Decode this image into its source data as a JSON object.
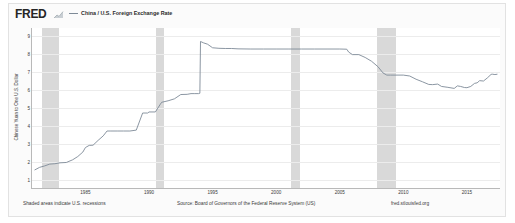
{
  "header": {
    "logo_text": "FRED",
    "logo_icon": "fred-graph-icon",
    "legend": [
      {
        "label": "China / U.S. Foreign Exchange Rate",
        "color": "#7e8a97",
        "swatch_icon": "line-swatch-icon"
      }
    ]
  },
  "footer": {
    "recession_note": "Shaded areas indicate U.S. recessions",
    "source": "Source: Board of Governors of the Federal Reserve System (US)",
    "url": "fred.stlouisfed.org"
  },
  "chart_data": {
    "type": "line",
    "title": "China / U.S. Foreign Exchange Rate",
    "xlabel": "",
    "ylabel": "Chinese Yuan to One U.S. Dollar",
    "xlim": [
      1980.8,
      2017.6
    ],
    "ylim": [
      0.55,
      9.45
    ],
    "grid": true,
    "legend_position": "top-left",
    "xticks": [
      "1985",
      "1990",
      "1995",
      "2000",
      "2005",
      "2010",
      "2015"
    ],
    "xtick_values": [
      1985,
      1990,
      1995,
      2000,
      2005,
      2010,
      2015
    ],
    "yticks": [
      "1",
      "2",
      "3",
      "4",
      "5",
      "6",
      "7",
      "8",
      "9"
    ],
    "ytick_values": [
      1,
      2,
      3,
      4,
      5,
      6,
      7,
      8,
      9
    ],
    "series": [
      {
        "name": "China / U.S. Foreign Exchange Rate",
        "color": "#7e8a97",
        "x": [
          1981.0,
          1981.4,
          1981.8,
          1982.2,
          1982.6,
          1983.0,
          1983.5,
          1984.0,
          1984.4,
          1984.8,
          1985.0,
          1985.3,
          1985.6,
          1986.0,
          1986.4,
          1986.7,
          1987.0,
          1987.5,
          1988.0,
          1988.5,
          1989.0,
          1989.5,
          1989.9,
          1990.0,
          1990.5,
          1990.9,
          1991.0,
          1991.5,
          1992.0,
          1992.5,
          1993.0,
          1993.3,
          1993.6,
          1993.9,
          1994.0,
          1994.05,
          1994.3,
          1994.6,
          1995.0,
          1995.5,
          1996.0,
          1996.5,
          1997.0,
          1998.0,
          1999.0,
          2000.0,
          2001.0,
          2002.0,
          2003.0,
          2004.0,
          2005.0,
          2005.55,
          2005.7,
          2006.0,
          2006.5,
          2007.0,
          2007.5,
          2008.0,
          2008.4,
          2008.7,
          2009.0,
          2009.5,
          2010.0,
          2010.5,
          2011.0,
          2011.5,
          2012.0,
          2012.3,
          2012.7,
          2013.0,
          2013.5,
          2014.0,
          2014.25,
          2014.5,
          2014.8,
          2015.0,
          2015.3,
          2015.6,
          2015.8,
          2016.0,
          2016.3,
          2016.6,
          2016.9,
          2017.0,
          2017.2,
          2017.4
        ],
        "y": [
          1.55,
          1.7,
          1.78,
          1.88,
          1.9,
          1.95,
          1.97,
          2.12,
          2.3,
          2.55,
          2.8,
          2.92,
          2.93,
          3.2,
          3.45,
          3.72,
          3.72,
          3.72,
          3.72,
          3.72,
          3.77,
          4.72,
          4.72,
          4.78,
          4.78,
          5.22,
          5.32,
          5.4,
          5.51,
          5.75,
          5.76,
          5.8,
          5.8,
          5.8,
          5.82,
          8.7,
          8.62,
          8.55,
          8.35,
          8.32,
          8.31,
          8.31,
          8.29,
          8.28,
          8.28,
          8.28,
          8.28,
          8.28,
          8.28,
          8.28,
          8.28,
          8.27,
          8.11,
          7.97,
          7.97,
          7.81,
          7.6,
          7.3,
          6.95,
          6.83,
          6.83,
          6.83,
          6.83,
          6.78,
          6.6,
          6.46,
          6.31,
          6.3,
          6.33,
          6.2,
          6.15,
          6.09,
          6.23,
          6.2,
          6.14,
          6.13,
          6.2,
          6.37,
          6.4,
          6.52,
          6.5,
          6.67,
          6.87,
          6.88,
          6.86,
          6.88
        ]
      }
    ],
    "recessions": [
      {
        "start": 1981.55,
        "end": 1982.92
      },
      {
        "start": 1990.55,
        "end": 1991.18
      },
      {
        "start": 2001.2,
        "end": 2001.9
      },
      {
        "start": 2007.95,
        "end": 2009.45
      }
    ]
  }
}
